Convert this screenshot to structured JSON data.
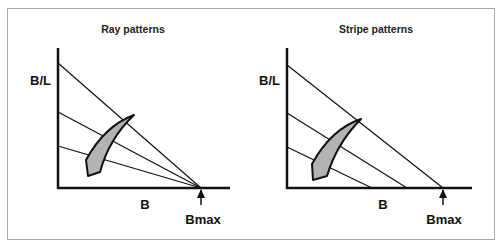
{
  "panels": [
    {
      "title": "Ray patterns",
      "y_axis_label": "B/L",
      "x_axis_label": "B",
      "marker_label": "Bmax",
      "line_type": "rays converging at Bmax"
    },
    {
      "title": "Stripe patterns",
      "y_axis_label": "B/L",
      "x_axis_label": "B",
      "marker_label": "Bmax",
      "line_type": "parallel stripes"
    }
  ],
  "colors": {
    "line": "#111111",
    "shape_fill": "#b3b3b3",
    "frame": "#a9a9a9"
  }
}
